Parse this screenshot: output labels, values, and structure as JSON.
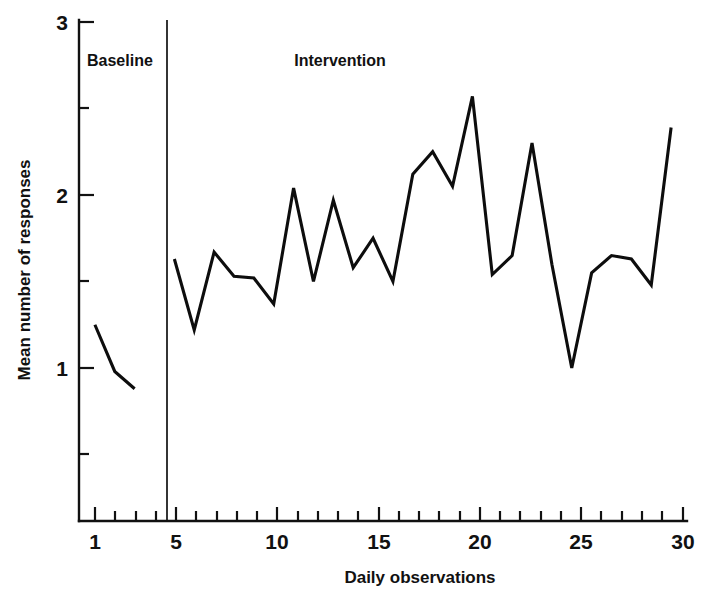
{
  "chart_data": {
    "type": "line",
    "title": "",
    "xlabel": "Daily observations",
    "ylabel": "Mean number of responses",
    "xlim": [
      0.2,
      30.8
    ],
    "ylim": [
      0.0,
      3.0
    ],
    "xticks": [
      1,
      2,
      3,
      4,
      5,
      6,
      7,
      8,
      9,
      10,
      11,
      12,
      13,
      14,
      15,
      16,
      17,
      18,
      19,
      20,
      21,
      22,
      23,
      24,
      25,
      26,
      27,
      28,
      29,
      30
    ],
    "xticklabels_shown": {
      "1": "1",
      "5": "5",
      "10": "10",
      "15": "15",
      "20": "20",
      "25": "25",
      "30": "30"
    },
    "yticks": [
      0.5,
      1.0,
      1.5,
      2.0,
      2.5,
      3.0
    ],
    "yticklabels_shown": {
      "1": "1",
      "2": "2",
      "3": "3"
    },
    "grid": false,
    "legend": "none",
    "line_color": "#0d0d0d",
    "phases": [
      {
        "name": "Baseline",
        "label": "Baseline",
        "x_start": 1,
        "x_end": 3,
        "divider_x": 4.05
      },
      {
        "name": "Intervention",
        "label": "Intervention",
        "x_start": 5,
        "x_end": 30
      }
    ],
    "series": [
      {
        "name": "Baseline",
        "x": [
          1,
          2,
          3
        ],
        "values": [
          1.25,
          0.98,
          0.88
        ]
      },
      {
        "name": "Intervention",
        "x": [
          5,
          6,
          7,
          8,
          9,
          10,
          11,
          12,
          13,
          14,
          15,
          16,
          17,
          18,
          19,
          20,
          21,
          22,
          23,
          24,
          25,
          26,
          27,
          28,
          29,
          30
        ],
        "values": [
          1.63,
          1.22,
          1.67,
          1.53,
          1.52,
          1.37,
          2.04,
          1.5,
          1.97,
          1.58,
          1.75,
          1.5,
          2.12,
          2.25,
          2.05,
          2.57,
          1.54,
          1.65,
          2.3,
          1.6,
          1.0,
          1.55,
          1.65,
          1.63,
          1.48,
          2.39
        ]
      }
    ]
  },
  "axes": {
    "y_axis_title": "Mean number of responses",
    "x_axis_title": "Daily observations",
    "y_labels": [
      {
        "value": 3,
        "text": "3"
      },
      {
        "value": 2,
        "text": "2"
      },
      {
        "value": 1,
        "text": "1"
      }
    ],
    "x_labels": [
      {
        "value": 1,
        "text": "1"
      },
      {
        "value": 5,
        "text": "5"
      },
      {
        "value": 10,
        "text": "10"
      },
      {
        "value": 15,
        "text": "15"
      },
      {
        "value": 20,
        "text": "20"
      },
      {
        "value": 25,
        "text": "25"
      },
      {
        "value": 30,
        "text": "30"
      }
    ]
  },
  "annotations": {
    "baseline_label": "Baseline",
    "intervention_label": "Intervention"
  }
}
